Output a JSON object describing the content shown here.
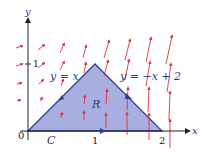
{
  "figure": {
    "axes": {
      "x_label": "x",
      "y_label": "y",
      "origin_label": "0",
      "x_ticks": [
        "1",
        "2"
      ],
      "y_ticks": [
        "1"
      ]
    },
    "region": {
      "label": "R",
      "vertices": [
        [
          0,
          0
        ],
        [
          1,
          1
        ],
        [
          2,
          0
        ]
      ],
      "fill": "#a9aee0",
      "edge": "#2d3f8f"
    },
    "curve": {
      "label": "C",
      "orientation": "clockwise"
    },
    "line_labels": {
      "left": "y = x",
      "right": "y = −x + 2"
    },
    "vector_field": {
      "color": "#d9313a"
    }
  },
  "colors": {
    "axis": "#222222",
    "region_fill": "#a9aee0",
    "region_edge": "#2d3f8f",
    "arrows": "#d9313a",
    "text": "#2a3a8a"
  }
}
